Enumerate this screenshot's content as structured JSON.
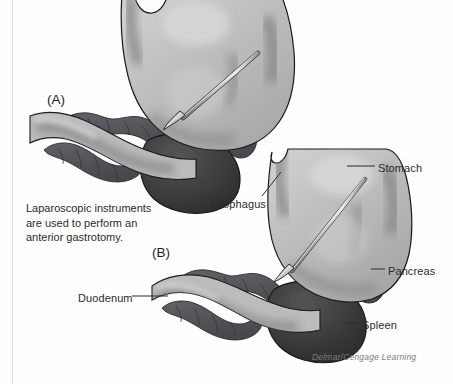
{
  "figure": {
    "panels": [
      {
        "id": "a",
        "label": "(A)"
      },
      {
        "id": "b",
        "label": "(B)"
      }
    ],
    "caption": "Laparoscopic instruments are used to perform an anterior gastrotomy.",
    "credit": "Delmar/Cengage Learning",
    "callouts": [
      {
        "id": "stomach",
        "label": "Stomach"
      },
      {
        "id": "esophagus",
        "label": "Esophagus"
      },
      {
        "id": "pancreas",
        "label": "Pancreas"
      },
      {
        "id": "spleen",
        "label": "Spleen"
      },
      {
        "id": "duodenum",
        "label": "Duodenum"
      }
    ],
    "colors": {
      "background": "#fefefe",
      "outline": "#1a1a1a",
      "stomach_light": "#b9b9b9",
      "stomach_highlight": "#d2d2d2",
      "stomach_shadow": "#8e8e8e",
      "pancreas": "#55555a",
      "spleen": "#3a3a3a",
      "instrument": "#c9c9c9",
      "label_text": "#2b2b2b",
      "credit_text": "#7d7d7d",
      "scan_line": "#dcdcdc"
    }
  }
}
